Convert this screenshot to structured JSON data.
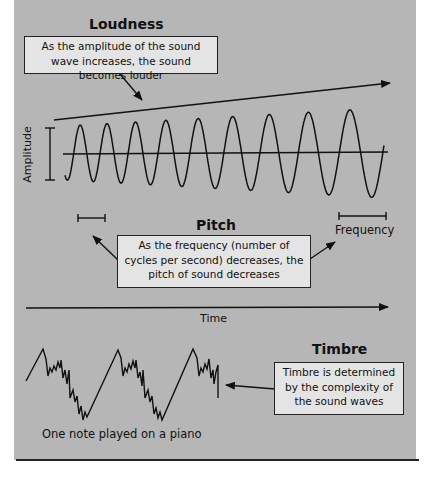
{
  "loudness": {
    "heading": "Loudness",
    "description": "As the amplitude of the sound wave increases, the sound becomes louder"
  },
  "pitch": {
    "heading": "Pitch",
    "description": "As the frequency (number of cycles per second) decreases, the pitch of sound decreases"
  },
  "timbre": {
    "heading": "Timbre",
    "description": "Timbre is determined by the complexity of the sound waves"
  },
  "labels": {
    "amplitude": "Amplitude",
    "frequency": "Frequency",
    "time": "Time",
    "piano_caption": "One note played on a piano"
  },
  "colors": {
    "panel": "#b6b6b6",
    "box": "#e4e4e4",
    "ink": "#111111"
  }
}
